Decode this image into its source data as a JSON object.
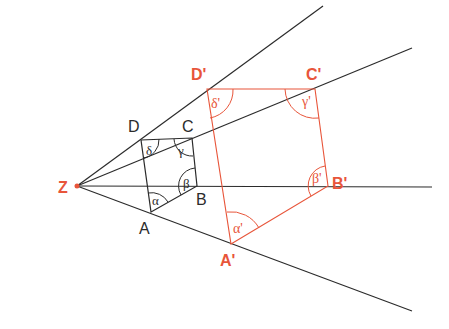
{
  "diagram": {
    "colors": {
      "original": "#2b2b2b",
      "image": "#e8553a"
    },
    "center": {
      "label": "Z"
    },
    "original_vertices": [
      "A",
      "B",
      "C",
      "D"
    ],
    "image_vertices": [
      "A'",
      "B'",
      "C'",
      "D'"
    ],
    "original_angles": [
      "α",
      "β",
      "γ",
      "δ"
    ],
    "image_angles": [
      "α'",
      "β'",
      "γ'",
      "δ'"
    ]
  }
}
